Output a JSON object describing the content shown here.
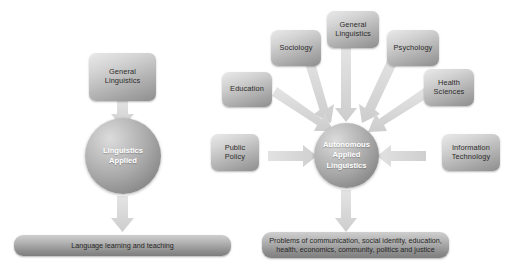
{
  "figure": {
    "background_color": "#ffffff",
    "node_fill": "#b4b4b4",
    "arrow_color": "#d8d8d8",
    "sphere_text_color": "#ffffff",
    "box_text_color": "#2b2b2b"
  },
  "diagrams": [
    {
      "id": "linguistics-applied",
      "nodes": {
        "source": {
          "lines": [
            "General",
            "Linguistics"
          ]
        },
        "hub": {
          "lines": [
            "Linguistics",
            "Applied"
          ]
        },
        "outcome": {
          "lines": [
            "Language learning and teaching"
          ]
        }
      },
      "arrows": [
        {
          "from": "source",
          "to": "hub",
          "direction": "down"
        },
        {
          "from": "hub",
          "to": "outcome",
          "direction": "down"
        }
      ]
    },
    {
      "id": "autonomous-applied-linguistics",
      "nodes": {
        "hub": {
          "lines": [
            "Autonomous",
            "Applied",
            "Linguistics"
          ]
        },
        "outcome": {
          "lines": [
            "Problems of communication, social identity, education,",
            "health, economics, community, politics and justice"
          ]
        },
        "contributors": [
          {
            "key": "sociology",
            "lines": [
              "Sociology"
            ]
          },
          {
            "key": "general-linguistics",
            "lines": [
              "General",
              "Linguistics"
            ]
          },
          {
            "key": "psychology",
            "lines": [
              "Psychology"
            ]
          },
          {
            "key": "education",
            "lines": [
              "Education"
            ]
          },
          {
            "key": "health-sciences",
            "lines": [
              "Health",
              "Sciences"
            ]
          },
          {
            "key": "public-policy",
            "lines": [
              "Public",
              "Policy"
            ]
          },
          {
            "key": "information-technology",
            "lines": [
              "Information",
              "Technology"
            ]
          }
        ]
      },
      "arrows": [
        {
          "from": "sociology",
          "to": "hub",
          "direction": "diagonal-down-right"
        },
        {
          "from": "general-linguistics",
          "to": "hub",
          "direction": "down"
        },
        {
          "from": "psychology",
          "to": "hub",
          "direction": "diagonal-down-left"
        },
        {
          "from": "education",
          "to": "hub",
          "direction": "diagonal-down-right"
        },
        {
          "from": "health-sciences",
          "to": "hub",
          "direction": "diagonal-down-left"
        },
        {
          "from": "public-policy",
          "to": "hub",
          "direction": "right"
        },
        {
          "from": "information-technology",
          "to": "hub",
          "direction": "left"
        },
        {
          "from": "hub",
          "to": "outcome",
          "direction": "down"
        }
      ]
    }
  ]
}
